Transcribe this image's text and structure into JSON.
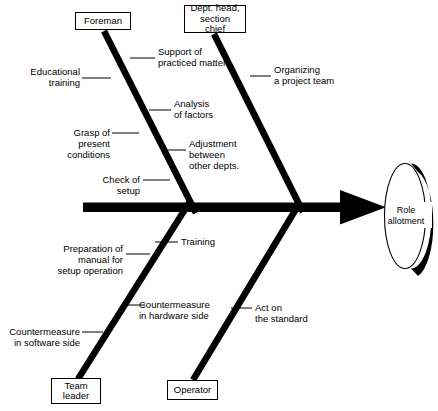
{
  "diagram": {
    "type": "fishbone-ishikawa",
    "effect": {
      "label": "Role\nallotment"
    },
    "categories": [
      {
        "id": "foreman",
        "label": "Foreman",
        "position": "top-left"
      },
      {
        "id": "dept-head",
        "label": "Dept. head,\nsection chief",
        "position": "top-right"
      },
      {
        "id": "team-leader",
        "label": "Team\nleader",
        "position": "bottom-left"
      },
      {
        "id": "operator",
        "label": "Operator",
        "position": "bottom-right"
      }
    ],
    "causes": [
      {
        "id": "support-practiced-matters",
        "label": "Support of\npracticed matters",
        "category": "foreman",
        "align": "left"
      },
      {
        "id": "educational-training",
        "label": "Educational\ntraining",
        "category": "foreman",
        "align": "right"
      },
      {
        "id": "analysis-of-factors",
        "label": "Analysis\nof factors",
        "category": "foreman",
        "align": "left"
      },
      {
        "id": "grasp-present-conditions",
        "label": "Grasp of\npresent\nconditions",
        "category": "foreman",
        "align": "right"
      },
      {
        "id": "adjustment-between-other-depts",
        "label": "Adjustment\nbetween\nother depts.",
        "category": "foreman",
        "align": "left"
      },
      {
        "id": "check-of-setup",
        "label": "Check of\nsetup",
        "category": "foreman",
        "align": "right"
      },
      {
        "id": "organizing-project-team",
        "label": "Organizing\na project team",
        "category": "dept-head",
        "align": "left"
      },
      {
        "id": "training",
        "label": "Training",
        "category": "operator",
        "align": "left"
      },
      {
        "id": "preparation-of-manual",
        "label": "Preparation of\nmanual for\nsetup operation",
        "category": "team-leader",
        "align": "right"
      },
      {
        "id": "countermeasure-hardware",
        "label": "Countermeasure\nin hardware side",
        "category": "team-leader",
        "align": "left"
      },
      {
        "id": "countermeasure-software",
        "label": "Countermeasure\nin software side",
        "category": "team-leader",
        "align": "right"
      },
      {
        "id": "act-on-standard",
        "label": "Act on\nthe standard",
        "category": "operator",
        "align": "left"
      }
    ],
    "colors": {
      "stroke": "#000000",
      "background": "#ffffff",
      "text": "#000000"
    }
  }
}
